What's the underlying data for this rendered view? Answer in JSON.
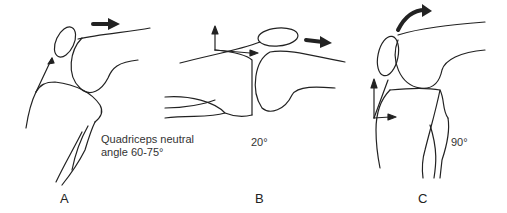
{
  "figure": {
    "panels": [
      {
        "id": "A",
        "letter": "A",
        "caption_line1": "Quadriceps neutral",
        "caption_line2": "angle 60-75°"
      },
      {
        "id": "B",
        "letter": "B",
        "angle": "20°"
      },
      {
        "id": "C",
        "letter": "C",
        "angle": "90°"
      }
    ],
    "colors": {
      "line": "#222222",
      "background": "#ffffff"
    }
  }
}
